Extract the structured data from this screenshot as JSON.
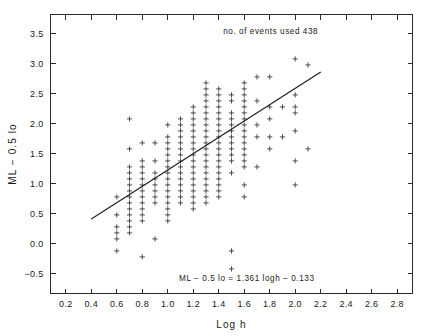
{
  "chart_data": {
    "type": "scatter",
    "title": "",
    "xlabel": "Log h",
    "ylabel": "ML − 0.5 lo",
    "xlim": [
      0.08,
      2.92
    ],
    "ylim": [
      -0.83,
      3.82
    ],
    "grid": false,
    "legend": "none",
    "xticks": [
      0.2,
      0.4,
      0.6,
      0.8,
      1.0,
      1.2,
      1.4,
      1.6,
      1.8,
      2.0,
      2.2,
      2.4,
      2.6,
      2.8
    ],
    "xtick_labels": [
      "0.2",
      "0.4",
      "0.6",
      "0.8",
      "1.0",
      "1.2",
      "1.4",
      "1.6",
      "1.8",
      "2.0",
      "2.2",
      "2.4",
      "2.6",
      "2.8"
    ],
    "yticks": [
      -0.5,
      0.0,
      0.5,
      1.0,
      1.5,
      2.0,
      2.5,
      3.0,
      3.5
    ],
    "ytick_labels": [
      "−0.5",
      "0.0",
      "0.5",
      "1.0",
      "1.5",
      "2.0",
      "2.5",
      "3.0",
      "3.5"
    ],
    "marker": "plus",
    "marker_color": "#3c3c3c",
    "annotations": [
      {
        "name": "events-count-annotation",
        "text": "no. of events used   438",
        "x": 2.18,
        "y": 3.5
      },
      {
        "name": "regression-equation-annotation",
        "text": "ML − 0.5 lo  =  1.361 logh − 0.133",
        "x": 1.62,
        "y": -0.62
      }
    ],
    "fit": {
      "name": "least-squares-fit",
      "equation": "ML − 0.5 lo  =  1.361 logh − 0.133",
      "slope": 1.361,
      "intercept": -0.133,
      "x_start": 0.4,
      "x_end": 2.2,
      "y_start": 0.411,
      "y_end": 2.861,
      "color": "#222222"
    },
    "n_points_label": "no. of events used   438",
    "n_points": 438,
    "points": [
      [
        0.6,
        0.78
      ],
      [
        0.6,
        0.48
      ],
      [
        0.6,
        0.28
      ],
      [
        0.6,
        0.18
      ],
      [
        0.6,
        0.08
      ],
      [
        0.6,
        -0.12
      ],
      [
        0.7,
        2.08
      ],
      [
        0.7,
        1.58
      ],
      [
        0.7,
        1.28
      ],
      [
        0.7,
        1.18
      ],
      [
        0.7,
        1.08
      ],
      [
        0.7,
        0.98
      ],
      [
        0.7,
        0.88
      ],
      [
        0.7,
        0.78
      ],
      [
        0.7,
        0.68
      ],
      [
        0.7,
        0.58
      ],
      [
        0.7,
        0.48
      ],
      [
        0.7,
        0.38
      ],
      [
        0.7,
        0.28
      ],
      [
        0.7,
        0.18
      ],
      [
        0.8,
        1.68
      ],
      [
        0.8,
        1.38
      ],
      [
        0.8,
        1.28
      ],
      [
        0.8,
        1.18
      ],
      [
        0.8,
        1.08
      ],
      [
        0.8,
        0.98
      ],
      [
        0.8,
        0.88
      ],
      [
        0.8,
        0.78
      ],
      [
        0.8,
        0.68
      ],
      [
        0.8,
        0.58
      ],
      [
        0.8,
        0.48
      ],
      [
        0.8,
        0.38
      ],
      [
        0.8,
        -0.22
      ],
      [
        0.9,
        1.68
      ],
      [
        0.9,
        1.38
      ],
      [
        0.9,
        1.18
      ],
      [
        0.9,
        1.08
      ],
      [
        0.9,
        0.98
      ],
      [
        0.9,
        0.88
      ],
      [
        0.9,
        0.78
      ],
      [
        0.9,
        0.68
      ],
      [
        0.9,
        0.08
      ],
      [
        1.0,
        1.98
      ],
      [
        1.0,
        1.78
      ],
      [
        1.0,
        1.68
      ],
      [
        1.0,
        1.58
      ],
      [
        1.0,
        1.48
      ],
      [
        1.0,
        1.38
      ],
      [
        1.0,
        1.28
      ],
      [
        1.0,
        1.18
      ],
      [
        1.0,
        1.08
      ],
      [
        1.0,
        0.98
      ],
      [
        1.0,
        0.88
      ],
      [
        1.0,
        0.78
      ],
      [
        1.0,
        0.68
      ],
      [
        1.0,
        0.58
      ],
      [
        1.0,
        0.48
      ],
      [
        1.0,
        0.38
      ],
      [
        1.1,
        2.08
      ],
      [
        1.1,
        1.98
      ],
      [
        1.1,
        1.88
      ],
      [
        1.1,
        1.78
      ],
      [
        1.1,
        1.68
      ],
      [
        1.1,
        1.58
      ],
      [
        1.1,
        1.48
      ],
      [
        1.1,
        1.38
      ],
      [
        1.1,
        1.28
      ],
      [
        1.1,
        1.18
      ],
      [
        1.1,
        1.08
      ],
      [
        1.1,
        0.98
      ],
      [
        1.1,
        0.88
      ],
      [
        1.1,
        0.78
      ],
      [
        1.1,
        0.68
      ],
      [
        1.2,
        2.28
      ],
      [
        1.2,
        2.18
      ],
      [
        1.2,
        2.08
      ],
      [
        1.2,
        1.98
      ],
      [
        1.2,
        1.88
      ],
      [
        1.2,
        1.78
      ],
      [
        1.2,
        1.68
      ],
      [
        1.2,
        1.58
      ],
      [
        1.2,
        1.48
      ],
      [
        1.2,
        1.38
      ],
      [
        1.2,
        1.28
      ],
      [
        1.2,
        1.18
      ],
      [
        1.2,
        1.08
      ],
      [
        1.2,
        0.98
      ],
      [
        1.2,
        0.88
      ],
      [
        1.2,
        0.78
      ],
      [
        1.2,
        0.68
      ],
      [
        1.2,
        0.58
      ],
      [
        1.3,
        2.68
      ],
      [
        1.3,
        2.58
      ],
      [
        1.3,
        2.48
      ],
      [
        1.3,
        2.38
      ],
      [
        1.3,
        2.28
      ],
      [
        1.3,
        2.18
      ],
      [
        1.3,
        2.08
      ],
      [
        1.3,
        1.98
      ],
      [
        1.3,
        1.88
      ],
      [
        1.3,
        1.78
      ],
      [
        1.3,
        1.68
      ],
      [
        1.3,
        1.58
      ],
      [
        1.3,
        1.48
      ],
      [
        1.3,
        1.38
      ],
      [
        1.3,
        1.28
      ],
      [
        1.3,
        1.18
      ],
      [
        1.3,
        1.08
      ],
      [
        1.3,
        0.98
      ],
      [
        1.3,
        0.88
      ],
      [
        1.3,
        0.78
      ],
      [
        1.3,
        0.68
      ],
      [
        1.4,
        2.58
      ],
      [
        1.4,
        2.48
      ],
      [
        1.4,
        2.38
      ],
      [
        1.4,
        2.28
      ],
      [
        1.4,
        2.18
      ],
      [
        1.4,
        2.08
      ],
      [
        1.4,
        1.98
      ],
      [
        1.4,
        1.88
      ],
      [
        1.4,
        1.78
      ],
      [
        1.4,
        1.68
      ],
      [
        1.4,
        1.58
      ],
      [
        1.4,
        1.48
      ],
      [
        1.4,
        1.38
      ],
      [
        1.4,
        1.28
      ],
      [
        1.4,
        1.18
      ],
      [
        1.4,
        1.08
      ],
      [
        1.4,
        0.98
      ],
      [
        1.4,
        0.88
      ],
      [
        1.4,
        0.78
      ],
      [
        1.5,
        2.48
      ],
      [
        1.5,
        2.38
      ],
      [
        1.5,
        2.18
      ],
      [
        1.5,
        2.08
      ],
      [
        1.5,
        1.98
      ],
      [
        1.5,
        1.88
      ],
      [
        1.5,
        1.78
      ],
      [
        1.5,
        1.68
      ],
      [
        1.5,
        1.58
      ],
      [
        1.5,
        1.48
      ],
      [
        1.5,
        1.38
      ],
      [
        1.5,
        1.18
      ],
      [
        1.5,
        -0.12
      ],
      [
        1.5,
        -0.42
      ],
      [
        1.6,
        2.68
      ],
      [
        1.6,
        2.58
      ],
      [
        1.6,
        2.48
      ],
      [
        1.6,
        2.38
      ],
      [
        1.6,
        2.28
      ],
      [
        1.6,
        2.18
      ],
      [
        1.6,
        2.08
      ],
      [
        1.6,
        1.98
      ],
      [
        1.6,
        1.88
      ],
      [
        1.6,
        1.78
      ],
      [
        1.6,
        1.68
      ],
      [
        1.6,
        1.58
      ],
      [
        1.6,
        1.48
      ],
      [
        1.6,
        1.38
      ],
      [
        1.6,
        1.28
      ],
      [
        1.6,
        0.98
      ],
      [
        1.6,
        0.78
      ],
      [
        1.7,
        2.78
      ],
      [
        1.7,
        2.38
      ],
      [
        1.7,
        1.98
      ],
      [
        1.7,
        1.78
      ],
      [
        1.7,
        1.28
      ],
      [
        1.8,
        2.78
      ],
      [
        1.8,
        2.28
      ],
      [
        1.8,
        2.08
      ],
      [
        1.8,
        1.78
      ],
      [
        1.8,
        1.58
      ],
      [
        1.9,
        2.28
      ],
      [
        1.9,
        1.78
      ],
      [
        2.0,
        3.08
      ],
      [
        2.0,
        2.48
      ],
      [
        2.0,
        2.28
      ],
      [
        2.0,
        2.18
      ],
      [
        2.0,
        1.88
      ],
      [
        2.0,
        1.38
      ],
      [
        2.0,
        0.98
      ],
      [
        2.1,
        2.98
      ],
      [
        2.1,
        1.58
      ]
    ]
  },
  "figure": {
    "background": "#ffffff",
    "axis_color": "#2b2b2b"
  }
}
